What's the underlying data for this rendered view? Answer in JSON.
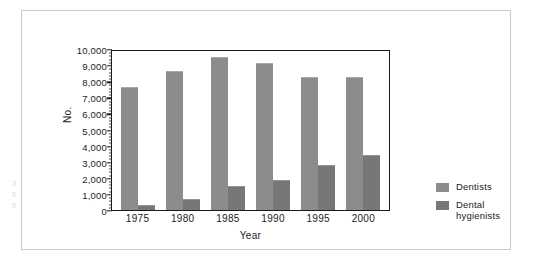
{
  "chart_data": {
    "type": "bar",
    "title": "",
    "xlabel": "Year",
    "ylabel": "No.",
    "categories": [
      "1975",
      "1980",
      "1985",
      "1990",
      "1995",
      "2000"
    ],
    "series": [
      {
        "name": "Dentists",
        "color": "#8c8c8c",
        "values": [
          7550,
          8580,
          9450,
          9080,
          8230,
          8180
        ]
      },
      {
        "name": "Dental hygienists",
        "color": "#777777",
        "values": [
          270,
          600,
          1400,
          1780,
          2750,
          3350
        ]
      }
    ],
    "ylim": [
      0,
      10000
    ],
    "yticks": [
      0,
      1000,
      2000,
      3000,
      4000,
      5000,
      6000,
      7000,
      8000,
      9000,
      10000
    ],
    "ytick_labels": [
      "0",
      "1,000",
      "2,000",
      "3,000",
      "4,000",
      "5,000",
      "6,000",
      "7,000",
      "8,000",
      "9,000",
      "10,000"
    ],
    "grid": false,
    "legend_position": "right",
    "legend_entries": [
      {
        "label": "Dentists"
      },
      {
        "label_line1": "Dental",
        "label_line2": "hygienists"
      }
    ]
  },
  "margin_marks": [
    "3",
    "5",
    "0"
  ]
}
